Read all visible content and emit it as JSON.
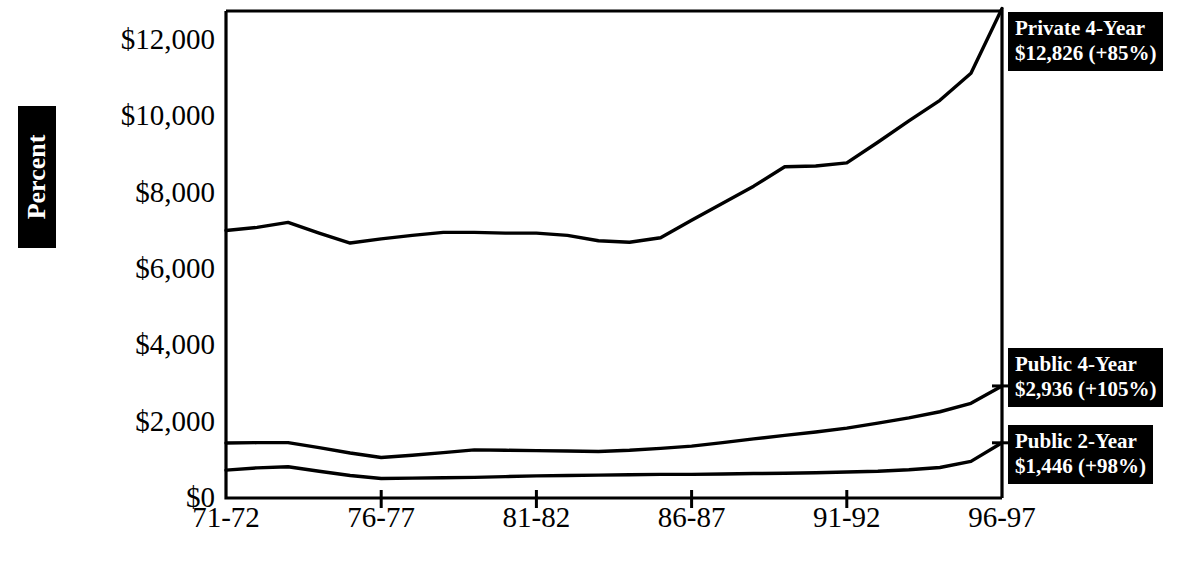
{
  "chart_data": {
    "type": "line",
    "title": "",
    "xlabel": "",
    "ylabel": "Percent",
    "ylim": [
      0,
      13000
    ],
    "yticks": [
      0,
      2000,
      4000,
      6000,
      8000,
      10000,
      12000
    ],
    "ytick_labels": [
      "$0",
      "$2,000",
      "$4,000",
      "$6,000",
      "$8,000",
      "$10,000",
      "$12,000"
    ],
    "xtick_labels": [
      "71-72",
      "76-77",
      "81-82",
      "86-87",
      "91-92",
      "96-97"
    ],
    "xtick_values": [
      0,
      5,
      10,
      15,
      20,
      25
    ],
    "xlim": [
      0,
      25
    ],
    "grid": false,
    "legend_position": "right-inline-callout",
    "series": [
      {
        "name": "Private 4-Year",
        "end_value": 12826,
        "end_label": "$12,826 (+85%)",
        "percent_change": "+85%",
        "x": [
          0,
          1,
          2,
          3,
          4,
          5,
          6,
          7,
          8,
          9,
          10,
          11,
          12,
          13,
          14,
          15,
          16,
          17,
          18,
          19,
          20,
          21,
          22,
          23,
          24,
          25
        ],
        "values": [
          7010,
          7090,
          7220,
          6940,
          6680,
          6790,
          6880,
          6960,
          6960,
          6940,
          6940,
          6880,
          6740,
          6700,
          6820,
          7280,
          7720,
          8170,
          8680,
          8700,
          8780,
          9320,
          9880,
          10420,
          11130,
          12826
        ]
      },
      {
        "name": "Public 4-Year",
        "end_value": 2936,
        "end_label": "$2,936 (+105%)",
        "percent_change": "+105%",
        "x": [
          0,
          1,
          2,
          3,
          4,
          5,
          6,
          7,
          8,
          9,
          10,
          11,
          12,
          13,
          14,
          15,
          16,
          17,
          18,
          19,
          20,
          21,
          22,
          23,
          24,
          25
        ],
        "values": [
          1440,
          1450,
          1450,
          1320,
          1180,
          1060,
          1120,
          1190,
          1260,
          1250,
          1240,
          1230,
          1220,
          1250,
          1300,
          1360,
          1450,
          1550,
          1640,
          1730,
          1830,
          1960,
          2100,
          2260,
          2480,
          2936
        ]
      },
      {
        "name": "Public 2-Year",
        "end_value": 1446,
        "end_label": "$1,446 (+98%)",
        "percent_change": "+98%",
        "x": [
          0,
          1,
          2,
          3,
          4,
          5,
          6,
          7,
          8,
          9,
          10,
          11,
          12,
          13,
          14,
          15,
          16,
          17,
          18,
          19,
          20,
          21,
          22,
          23,
          24,
          25
        ],
        "values": [
          730,
          790,
          820,
          700,
          590,
          510,
          520,
          530,
          540,
          560,
          580,
          590,
          600,
          610,
          620,
          620,
          630,
          640,
          650,
          660,
          680,
          700,
          740,
          800,
          960,
          1446
        ]
      }
    ]
  },
  "axis": {
    "y_title": "Percent"
  },
  "legend": {
    "private": {
      "line1": "Private 4-Year",
      "line2": "$12,826 (+85%)"
    },
    "public4": {
      "line1": "Public 4-Year",
      "line2": "$2,936 (+105%)"
    },
    "public2": {
      "line1": "Public 2-Year",
      "line2": "$1,446 (+98%)"
    }
  },
  "colors": {
    "line": "#000000",
    "background": "#ffffff",
    "legend_background": "#000000",
    "legend_text": "#ffffff"
  }
}
